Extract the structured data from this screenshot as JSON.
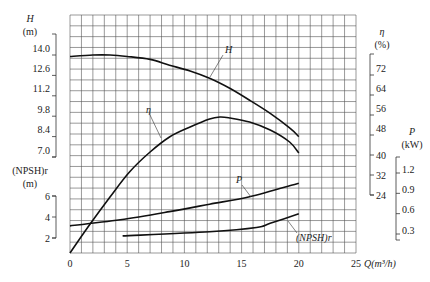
{
  "chart_data": {
    "type": "line",
    "title": "",
    "xlabel": "Q(m³/h)",
    "xlim": [
      0,
      25
    ],
    "x_ticks": [
      0,
      5,
      10,
      15,
      20,
      25
    ],
    "grid": true,
    "grid_cells": {
      "columns": 25,
      "rows": 22
    },
    "axes": [
      {
        "id": "H",
        "side": "left",
        "title": "H",
        "unit": "(m)",
        "ticks": [
          14.0,
          12.6,
          11.2,
          9.8,
          8.4,
          7.0
        ],
        "tick_labels": [
          "14.0",
          "12.6",
          "11.2",
          "9.8",
          "8.4",
          "7.0"
        ]
      },
      {
        "id": "NPSH",
        "side": "left",
        "title": "(NPSH)r",
        "unit": "(m)",
        "ticks": [
          6,
          4,
          2
        ],
        "tick_labels": [
          "6",
          "4",
          "2"
        ]
      },
      {
        "id": "eta",
        "side": "right",
        "title": "η",
        "unit": "(%)",
        "ticks": [
          72,
          64,
          56,
          48,
          40,
          32,
          24
        ],
        "tick_labels": [
          "72",
          "64",
          "56",
          "48",
          "40",
          "32",
          "24"
        ]
      },
      {
        "id": "P",
        "side": "right",
        "title": "P",
        "unit": "(kW)",
        "ticks": [
          1.2,
          0.9,
          0.6,
          0.3
        ],
        "tick_labels": [
          "1.2",
          "0.9",
          "0.6",
          "0.3"
        ]
      }
    ],
    "series": [
      {
        "name": "H",
        "axis": "H",
        "label": "H",
        "x": [
          0,
          2,
          3.5,
          5,
          7,
          8.7,
          10.5,
          12.2,
          14,
          15.7,
          17.5,
          19.2,
          20
        ],
        "values": [
          13.9,
          14.0,
          14.0,
          13.9,
          13.7,
          13.3,
          12.9,
          12.4,
          11.7,
          10.9,
          10.0,
          9.0,
          8.4
        ]
      },
      {
        "name": "η",
        "axis": "eta",
        "label": "η",
        "x": [
          0,
          1.7,
          3.5,
          5.2,
          7,
          8.7,
          10.5,
          12.2,
          13.1,
          14,
          15.7,
          17.5,
          19.2,
          20
        ],
        "values": [
          0.8,
          12.0,
          23.2,
          33.2,
          41.2,
          47.2,
          51.2,
          54.4,
          55.2,
          54.8,
          53.2,
          50.0,
          45.2,
          40.8
        ]
      },
      {
        "name": "P",
        "axis": "P",
        "label": "P",
        "x": [
          0,
          4.4,
          8.7,
          12.2,
          15.7,
          20
        ],
        "values": [
          0.42,
          0.51,
          0.63,
          0.74,
          0.85,
          1.05
        ]
      },
      {
        "name": "(NPSH)r",
        "axis": "NPSH",
        "label": "(NPSH)r",
        "x": [
          4.6,
          12.2,
          16.3,
          17.5,
          20
        ],
        "values": [
          2.2,
          2.6,
          3.0,
          3.4,
          4.3
        ]
      }
    ]
  }
}
